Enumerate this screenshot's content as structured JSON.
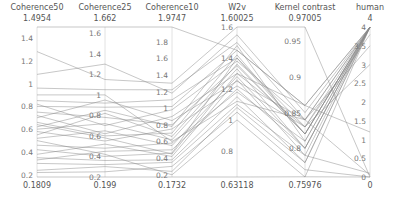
{
  "chart_data": {
    "type": "parallel_coordinates",
    "title": "",
    "axes": [
      {
        "name": "Coherence50",
        "min": 0.1809,
        "max": 1.4954,
        "ticks": [
          0.2,
          0.4,
          0.6,
          0.8,
          1,
          1.2,
          1.4
        ]
      },
      {
        "name": "Coherence25",
        "min": 0.199,
        "max": 1.662,
        "ticks": [
          0.2,
          0.4,
          0.6,
          0.8,
          1,
          1.2,
          1.4,
          1.6
        ]
      },
      {
        "name": "Coherence10",
        "min": 0.1732,
        "max": 1.9747,
        "ticks": [
          0.2,
          0.4,
          0.6,
          0.8,
          1,
          1.2,
          1.4,
          1.6,
          1.8
        ]
      },
      {
        "name": "W2v",
        "min": 0.63118,
        "max": 1.60025,
        "ticks": [
          0.8,
          1,
          1.2,
          1.4,
          1.6
        ]
      },
      {
        "name": "Kernel contrast",
        "min": 0.75976,
        "max": 0.97005,
        "ticks": [
          0.8,
          0.85,
          0.9,
          0.95
        ]
      },
      {
        "name": "human",
        "min": 0,
        "max": 4,
        "ticks": [
          0,
          0.5,
          1,
          1.5,
          2,
          2.5,
          3,
          3.5,
          4
        ]
      }
    ],
    "records": [
      [
        1.4954,
        1.662,
        1.9747,
        1.45,
        0.86,
        4
      ],
      [
        1.28,
        1.15,
        1.3,
        1.6,
        0.97005,
        0
      ],
      [
        1.08,
        1.3,
        1.18,
        1.55,
        0.85,
        4
      ],
      [
        0.96,
        1.05,
        1.22,
        1.5,
        0.84,
        4
      ],
      [
        0.85,
        0.92,
        1.1,
        1.4,
        0.83,
        3.8
      ],
      [
        0.82,
        0.7,
        0.98,
        1.38,
        0.84,
        4
      ],
      [
        0.8,
        0.88,
        1.02,
        1.45,
        0.86,
        4
      ],
      [
        0.75,
        0.78,
        0.8,
        1.35,
        0.82,
        4
      ],
      [
        0.72,
        0.62,
        0.9,
        1.3,
        0.83,
        4
      ],
      [
        0.7,
        0.95,
        0.85,
        1.25,
        0.84,
        3.5
      ],
      [
        0.66,
        0.6,
        0.7,
        1.42,
        0.82,
        4
      ],
      [
        0.62,
        0.85,
        0.78,
        1.48,
        0.81,
        4
      ],
      [
        0.6,
        0.72,
        0.62,
        1.33,
        0.8,
        4
      ],
      [
        0.58,
        0.55,
        0.75,
        1.22,
        0.83,
        3
      ],
      [
        0.55,
        0.82,
        0.66,
        1.36,
        0.82,
        4
      ],
      [
        0.52,
        0.65,
        0.55,
        1.28,
        0.8,
        4
      ],
      [
        0.46,
        0.48,
        0.58,
        1.18,
        0.81,
        4
      ],
      [
        0.42,
        0.4,
        0.46,
        1.4,
        0.82,
        4
      ],
      [
        0.38,
        0.52,
        0.42,
        1.26,
        0.79,
        0.1
      ],
      [
        0.35,
        0.36,
        0.38,
        1.15,
        0.78,
        4
      ],
      [
        0.33,
        0.45,
        0.5,
        1.2,
        0.8,
        4
      ],
      [
        0.3,
        0.32,
        0.35,
        1.1,
        0.79,
        4
      ],
      [
        0.24,
        0.3,
        0.24,
        1.08,
        0.78,
        4
      ],
      [
        0.22,
        0.25,
        0.3,
        1.05,
        0.77,
        0
      ],
      [
        0.1809,
        0.199,
        0.1732,
        0.63118,
        0.76,
        0
      ],
      [
        0.9,
        1.0,
        0.6,
        1.12,
        0.84,
        0.05
      ],
      [
        0.5,
        0.42,
        0.2,
        1.0,
        0.75976,
        4
      ],
      [
        0.64,
        0.58,
        0.45,
        1.3,
        0.86,
        1.2
      ]
    ],
    "xlabel": "",
    "ylabel": "",
    "grid": false,
    "legend": null
  }
}
